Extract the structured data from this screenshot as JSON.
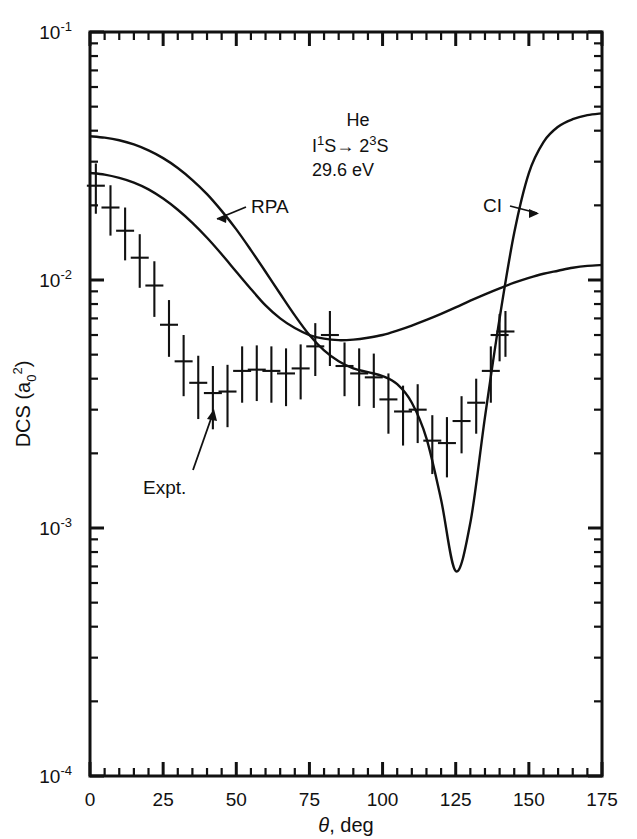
{
  "figure": {
    "background": "#ffffff",
    "ink": "#111111"
  },
  "axes": {
    "x": {
      "label_main": "θ",
      "label_rest": ", deg",
      "min": 0,
      "max": 175,
      "ticks": [
        0,
        25,
        50,
        75,
        100,
        125,
        150,
        175
      ],
      "tick_labels": [
        "0",
        "25",
        "50",
        "75",
        "100",
        "125",
        "150",
        "175"
      ],
      "minor_tick_step": 5
    },
    "y": {
      "label_prefix": "DCS (a",
      "label_sub": "0",
      "label_sup": "2",
      "label_suffix": ")",
      "min": 0.0001,
      "max": 0.1,
      "scale": "log",
      "decade_labels": [
        {
          "mantissa": "10",
          "exponent": "-1",
          "value": 0.1
        },
        {
          "mantissa": "10",
          "exponent": "-2",
          "value": 0.01
        },
        {
          "mantissa": "10",
          "exponent": "-3",
          "value": 0.001
        },
        {
          "mantissa": "10",
          "exponent": "-4",
          "value": 0.0001
        }
      ]
    }
  },
  "annotation_block": {
    "line1": "He",
    "line2_pre": "I",
    "line2_sup1": "1",
    "line2_mid": "S",
    "line2_arrow": "→",
    "line2_post": " 2",
    "line2_sup2": "3",
    "line2_end": "S",
    "line3": "29.6 eV"
  },
  "curve_labels": {
    "rpa": "RPA",
    "ci": "CI",
    "expt": "Expt."
  },
  "chart_data": {
    "type": "line",
    "title": "",
    "subtitle": "He I¹S→2³S, 29.6 eV",
    "xlabel": "θ, deg",
    "ylabel": "DCS (a₀²)",
    "xlim": [
      0,
      175
    ],
    "ylim": [
      0.0001,
      0.1
    ],
    "yscale": "log",
    "grid": false,
    "legend_position": "inline-annotations",
    "annotations": [
      "He",
      "I1S→2 3S",
      "29.6 eV",
      "RPA",
      "CI",
      "Expt."
    ],
    "series": [
      {
        "name": "RPA",
        "type": "line",
        "x": [
          0,
          5,
          10,
          15,
          20,
          25,
          30,
          35,
          40,
          45,
          50,
          55,
          60,
          65,
          70,
          75,
          80,
          85,
          90,
          95,
          100,
          105,
          110,
          115,
          120,
          125,
          130,
          135,
          140,
          145,
          150,
          155,
          160,
          165,
          170,
          175
        ],
        "y": [
          0.038,
          0.0375,
          0.0366,
          0.0352,
          0.0333,
          0.031,
          0.0283,
          0.0253,
          0.0222,
          0.019,
          0.016,
          0.0132,
          0.0108,
          0.0088,
          0.0072,
          0.006,
          0.0052,
          0.0047,
          0.0044,
          0.00425,
          0.0041,
          0.0038,
          0.0032,
          0.0023,
          0.0013,
          0.00067,
          0.00105,
          0.0028,
          0.007,
          0.0155,
          0.027,
          0.036,
          0.0415,
          0.0445,
          0.0462,
          0.047
        ]
      },
      {
        "name": "CI",
        "type": "line",
        "x": [
          0,
          5,
          10,
          15,
          20,
          25,
          30,
          35,
          40,
          45,
          50,
          55,
          60,
          65,
          70,
          75,
          80,
          85,
          90,
          95,
          100,
          105,
          110,
          115,
          120,
          125,
          130,
          135,
          140,
          145,
          150,
          155,
          160,
          165,
          170,
          175
        ],
        "y": [
          0.027,
          0.0266,
          0.0258,
          0.0247,
          0.0232,
          0.0213,
          0.0192,
          0.017,
          0.0148,
          0.0127,
          0.0108,
          0.0092,
          0.0079,
          0.007,
          0.0064,
          0.006,
          0.0058,
          0.00572,
          0.00575,
          0.00585,
          0.006,
          0.00625,
          0.00655,
          0.0069,
          0.0073,
          0.00775,
          0.00825,
          0.00875,
          0.00925,
          0.00975,
          0.0102,
          0.0106,
          0.0109,
          0.0112,
          0.0114,
          0.0115
        ]
      },
      {
        "name": "Expt.",
        "type": "errorbar",
        "x": [
          2,
          7,
          12,
          17,
          22,
          27,
          32,
          37,
          42,
          47,
          52,
          57,
          62,
          67,
          72,
          77,
          82,
          87,
          92,
          97,
          102,
          107,
          112,
          117,
          122,
          127,
          132,
          137,
          140,
          142
        ],
        "y": [
          0.024,
          0.0196,
          0.0158,
          0.0123,
          0.0095,
          0.0066,
          0.0047,
          0.00385,
          0.0035,
          0.00355,
          0.0043,
          0.00435,
          0.0043,
          0.0042,
          0.0044,
          0.0054,
          0.006,
          0.0045,
          0.0042,
          0.00405,
          0.0033,
          0.00295,
          0.003,
          0.00225,
          0.0022,
          0.0027,
          0.0032,
          0.0043,
          0.006,
          0.0062
        ],
        "yerr_low": [
          0.0055,
          0.0045,
          0.0038,
          0.003,
          0.0024,
          0.0017,
          0.0013,
          0.0011,
          0.001,
          0.001,
          0.0011,
          0.0011,
          0.0011,
          0.0011,
          0.0011,
          0.0013,
          0.0015,
          0.0011,
          0.0011,
          0.001,
          0.0009,
          0.0008,
          0.0008,
          0.0006,
          0.0006,
          0.0007,
          0.0008,
          0.0011,
          0.0013,
          0.0013
        ],
        "yerr_high": [
          0.0055,
          0.0045,
          0.0038,
          0.003,
          0.0024,
          0.0017,
          0.0013,
          0.0011,
          0.001,
          0.001,
          0.0011,
          0.0011,
          0.0011,
          0.0011,
          0.0011,
          0.0013,
          0.0015,
          0.0011,
          0.0011,
          0.001,
          0.0009,
          0.0008,
          0.0008,
          0.0006,
          0.0006,
          0.0007,
          0.0008,
          0.0011,
          0.0013,
          0.0013
        ]
      }
    ]
  }
}
